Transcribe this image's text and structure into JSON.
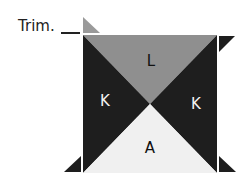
{
  "figure": {
    "annotation": {
      "text": "Trim."
    },
    "pieces": [
      {
        "id": "top",
        "label": "L",
        "color": "#8f8f8f"
      },
      {
        "id": "left",
        "label": "K",
        "color": "#1e1e1e"
      },
      {
        "id": "right",
        "label": "K",
        "color": "#1e1e1e"
      },
      {
        "id": "bottom",
        "label": "A",
        "color": "#f0f0f0"
      }
    ],
    "colors": {
      "light_gray": "#8f8f8f",
      "black": "#1e1e1e",
      "white": "#f0f0f0",
      "trim_triangle_top": "#9a9a9a"
    }
  }
}
